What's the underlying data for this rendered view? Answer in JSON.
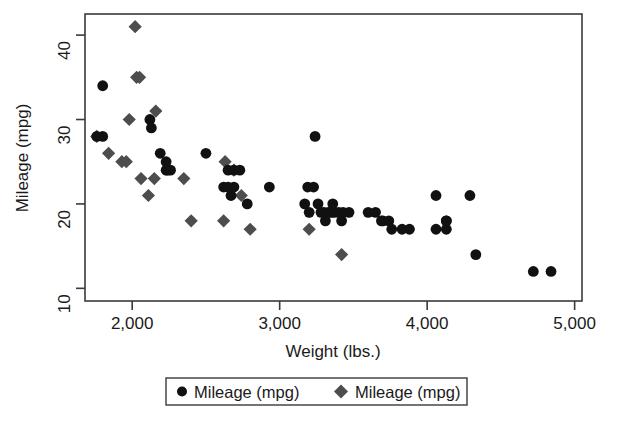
{
  "chart_data": {
    "type": "scatter",
    "title": "",
    "xlabel": "Weight (lbs.)",
    "ylabel": "Mileage (mpg)",
    "xlim": [
      1680,
      5050
    ],
    "ylim": [
      8.5,
      42.5
    ],
    "xticks": [
      2000,
      3000,
      4000,
      5000
    ],
    "xtick_labels": [
      "2,000",
      "3,000",
      "4,000",
      "5,000"
    ],
    "yticks": [
      10,
      20,
      30,
      40
    ],
    "ytick_labels": [
      "10",
      "20",
      "30",
      "40"
    ],
    "grid": false,
    "legend_position": "below-center",
    "series": [
      {
        "name": "Mileage (mpg)",
        "marker": "circle",
        "color": "#111111",
        "points": [
          [
            1800,
            34
          ],
          [
            1760,
            28
          ],
          [
            1800,
            28
          ],
          [
            2120,
            30
          ],
          [
            2130,
            29
          ],
          [
            2190,
            26
          ],
          [
            2230,
            25
          ],
          [
            2230,
            24
          ],
          [
            2240,
            24
          ],
          [
            2260,
            24
          ],
          [
            2500,
            26
          ],
          [
            2650,
            24
          ],
          [
            2690,
            24
          ],
          [
            2730,
            24
          ],
          [
            2620,
            22
          ],
          [
            2650,
            22
          ],
          [
            2670,
            21
          ],
          [
            2690,
            22
          ],
          [
            2780,
            20
          ],
          [
            2930,
            22
          ],
          [
            3240,
            28
          ],
          [
            3190,
            22
          ],
          [
            3230,
            22
          ],
          [
            3170,
            20
          ],
          [
            3200,
            19
          ],
          [
            3260,
            20
          ],
          [
            3280,
            19
          ],
          [
            3300,
            19
          ],
          [
            3310,
            18
          ],
          [
            3330,
            19
          ],
          [
            3350,
            19
          ],
          [
            3360,
            20
          ],
          [
            3370,
            19
          ],
          [
            3400,
            19
          ],
          [
            3420,
            18
          ],
          [
            3430,
            19
          ],
          [
            3470,
            19
          ],
          [
            3600,
            19
          ],
          [
            3650,
            19
          ],
          [
            3690,
            18
          ],
          [
            3700,
            18
          ],
          [
            3740,
            18
          ],
          [
            3760,
            17
          ],
          [
            3830,
            17
          ],
          [
            3880,
            17
          ],
          [
            4060,
            21
          ],
          [
            4130,
            18
          ],
          [
            4060,
            17
          ],
          [
            4130,
            17
          ],
          [
            4290,
            21
          ],
          [
            4130,
            18
          ],
          [
            4330,
            14
          ],
          [
            4720,
            12
          ],
          [
            4840,
            12
          ]
        ]
      },
      {
        "name": "Mileage (mpg)",
        "marker": "diamond",
        "color": "#4d4d4d",
        "points": [
          [
            2020,
            41
          ],
          [
            2030,
            35
          ],
          [
            2050,
            35
          ],
          [
            1760,
            28
          ],
          [
            1980,
            30
          ],
          [
            1840,
            26
          ],
          [
            1930,
            25
          ],
          [
            1960,
            25
          ],
          [
            2160,
            31
          ],
          [
            2060,
            23
          ],
          [
            2150,
            23
          ],
          [
            2350,
            23
          ],
          [
            2110,
            21
          ],
          [
            2400,
            18
          ],
          [
            2630,
            25
          ],
          [
            2690,
            24
          ],
          [
            2740,
            21
          ],
          [
            2620,
            18
          ],
          [
            2800,
            17
          ],
          [
            3200,
            17
          ],
          [
            3420,
            14
          ]
        ]
      }
    ]
  },
  "legend": {
    "entries": [
      {
        "label": "Mileage (mpg)",
        "marker": "circle-marker"
      },
      {
        "label": "Mileage (mpg)",
        "marker": "diamond-marker"
      }
    ]
  },
  "colors": {
    "circle_series": "#111111",
    "diamond_series": "#4d4d4d",
    "axis": "#3a3a3a",
    "background": "#ffffff"
  }
}
